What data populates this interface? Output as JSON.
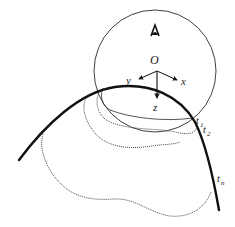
{
  "diagram": {
    "type": "geometric-schematic",
    "labels": {
      "origin": "O",
      "axis_x": "x",
      "axis_y": "y",
      "axis_z": "z",
      "t1_base": "t",
      "t1_sub": "1",
      "t2_base": "t",
      "t2_sub": "2",
      "tn_base": "t",
      "tn_sub": "n"
    },
    "elements": [
      {
        "name": "sphere-outline",
        "shape": "circle"
      },
      {
        "name": "eye-icon",
        "shape": "viewpoint-glyph"
      },
      {
        "name": "coordinate-frame",
        "axes": [
          "x",
          "y",
          "z"
        ]
      },
      {
        "name": "surface-curve",
        "style": "thick-solid"
      },
      {
        "name": "contour-t1",
        "style": "thin-solid"
      },
      {
        "name": "contour-t2",
        "style": "dotted"
      },
      {
        "name": "contour-tn",
        "style": "dotted"
      }
    ],
    "colors": {
      "stroke": "#1a1a1a",
      "background": "#ffffff"
    }
  }
}
